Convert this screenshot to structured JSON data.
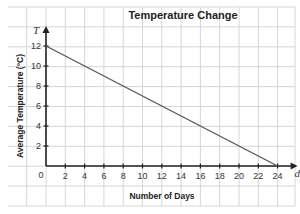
{
  "chart_data": {
    "type": "line",
    "title": "Temperature Change",
    "xlabel": "Number of Days",
    "ylabel": "Average Temperature (°C)",
    "x_var": "d",
    "y_var": "T",
    "xlim": [
      0,
      24
    ],
    "ylim": [
      0,
      12
    ],
    "x_ticks": [
      2,
      4,
      6,
      8,
      10,
      12,
      14,
      16,
      18,
      20,
      22,
      24
    ],
    "y_ticks": [
      2,
      4,
      6,
      8,
      10,
      12
    ],
    "origin_label": "0",
    "grid": true,
    "series": [
      {
        "name": "Average Temperature",
        "x": [
          0,
          24
        ],
        "values": [
          12,
          0
        ],
        "color": "#555555"
      }
    ]
  },
  "colors": {
    "grid": "#d6d6d6",
    "axis": "#222222",
    "line": "#555555",
    "background": "#ffffff"
  }
}
